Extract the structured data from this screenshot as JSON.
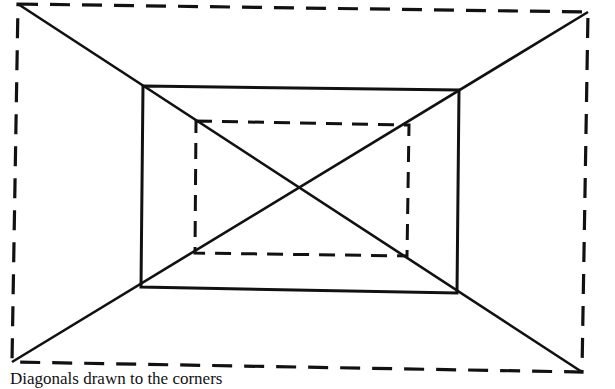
{
  "figure": {
    "stroke_color": "#111111",
    "background": "#ffffff",
    "elements": [
      {
        "name": "outer-rectangle",
        "style": "dashed"
      },
      {
        "name": "middle-rectangle",
        "style": "solid"
      },
      {
        "name": "inner-rectangle",
        "style": "dashed"
      },
      {
        "name": "diagonal-top-left-to-bottom-right",
        "style": "solid"
      },
      {
        "name": "diagonal-top-right-to-bottom-left",
        "style": "solid"
      }
    ]
  },
  "caption": "Diagonals drawn to the corners"
}
